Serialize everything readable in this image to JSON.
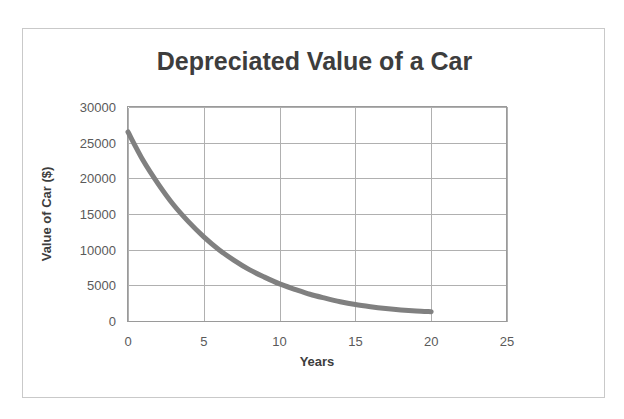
{
  "figure": {
    "border_color": "#c9c9c9",
    "background": "#ffffff"
  },
  "chart_data": {
    "type": "line",
    "title": "Depreciated Value of a Car",
    "xlabel": "Years",
    "ylabel": "Value of Car ($)",
    "xlim": [
      0,
      25
    ],
    "ylim": [
      0,
      30000
    ],
    "grid": true,
    "legend": false,
    "legend_position": "none",
    "series_color": "#808080",
    "series_width": 5,
    "xticks": [
      "0",
      "5",
      "10",
      "15",
      "20",
      "25"
    ],
    "xtick_values": [
      0,
      5,
      10,
      15,
      20,
      25
    ],
    "yticks": [
      "0",
      "5000",
      "10000",
      "15000",
      "20000",
      "25000",
      "30000"
    ],
    "ytick_values": [
      0,
      5000,
      10000,
      15000,
      20000,
      25000,
      30000
    ],
    "series": [
      {
        "name": "Depreciated Value",
        "x": [
          0,
          1,
          2,
          3,
          4,
          5,
          6,
          7,
          8,
          9,
          10,
          11,
          12,
          13,
          14,
          15,
          16,
          17,
          18,
          19,
          20
        ],
        "values": [
          26500,
          22500,
          19200,
          16300,
          13900,
          11800,
          10000,
          8500,
          7200,
          6150,
          5200,
          4450,
          3750,
          3200,
          2700,
          2300,
          2000,
          1750,
          1550,
          1400,
          1300
        ]
      }
    ]
  }
}
